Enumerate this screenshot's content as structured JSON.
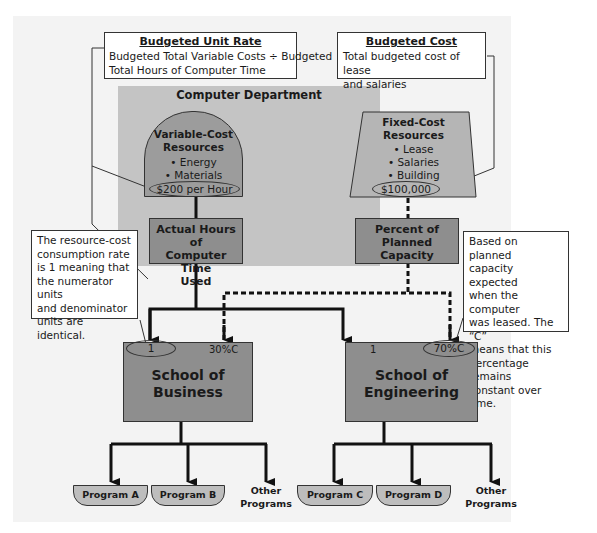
{
  "callouts": {
    "unit_rate": {
      "heading": "Budgeted Unit Rate",
      "line1": "Budgeted Total Variable Costs ÷ Budgeted",
      "line2": "Total Hours of Computer Time"
    },
    "budgeted_cost": {
      "heading": "Budgeted Cost",
      "line1": "Total budgeted cost of lease",
      "line2": "and salaries"
    },
    "consumption_rate": {
      "lines": [
        "The resource-cost",
        "consumption rate",
        "is 1 meaning that",
        "the numerator units",
        "and denominator",
        "units are identical."
      ]
    },
    "planned_capacity": {
      "lines": [
        "Based on planned",
        "capacity expected",
        "when the computer",
        "was leased. The “C”",
        "means that this",
        "percentage remains",
        "constant over time."
      ]
    }
  },
  "department": {
    "title": "Computer Department",
    "variable": {
      "title1": "Variable-Cost",
      "title2": "Resources",
      "items": [
        "• Energy",
        "• Materials"
      ],
      "rate": "$200 per Hour"
    },
    "fixed": {
      "title1": "Fixed-Cost",
      "title2": "Resources",
      "items": [
        "• Lease",
        "• Salaries",
        "• Building"
      ],
      "amount": "$100,000"
    },
    "driver_actual": [
      "Actual Hours of",
      "Computer Time",
      "Used"
    ],
    "driver_capacity": [
      "Percent of",
      "Planned",
      "Capacity"
    ]
  },
  "schools": [
    {
      "name1": "School of",
      "name2": "Business",
      "rate": "1",
      "capacity": "30%C"
    },
    {
      "name1": "School of",
      "name2": "Engineering",
      "rate": "1",
      "capacity": "70%C"
    }
  ],
  "programs": {
    "business": [
      "Program A",
      "Program B"
    ],
    "engineering": [
      "Program C",
      "Program D"
    ],
    "other": [
      "Other",
      "Programs"
    ]
  },
  "colors": {
    "panel": "#f3f3f3",
    "department": "#c4c4c4",
    "box": "#8e8e8e",
    "program": "#bdbdbd",
    "line": "#111111"
  }
}
